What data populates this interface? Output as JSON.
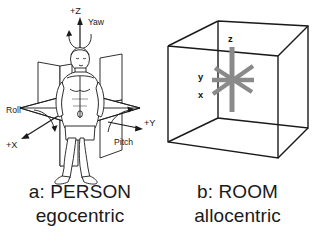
{
  "figure": {
    "background_color": "#ffffff",
    "ink_color": "#1a1a1a",
    "accent_gray": "#8a8a8a"
  },
  "panels": [
    {
      "id": "a",
      "name": "person-egocentric",
      "caption_line1": "a: PERSON",
      "caption_line2": "egocentric",
      "subject": "standing human figure at origin of three orthogonal planes",
      "axes": [
        {
          "name": "z-axis",
          "label": "+Z",
          "direction": "up",
          "rotation_label": "Yaw"
        },
        {
          "name": "x-axis",
          "label": "+X",
          "direction": "down-left",
          "rotation_label": "Roll"
        },
        {
          "name": "y-axis",
          "label": "+Y",
          "direction": "right",
          "rotation_label": "Pitch"
        }
      ],
      "rotation_labels": [
        "Yaw",
        "Roll",
        "Pitch"
      ]
    },
    {
      "id": "b",
      "name": "room-allocentric",
      "caption_line1": "b: ROOM",
      "caption_line2": "allocentric",
      "subject": "wireframe rectangular room box with gray three-axis star at center",
      "axes": [
        {
          "name": "z-axis",
          "label": "z",
          "direction": "vertical"
        },
        {
          "name": "y-axis",
          "label": "y",
          "direction": "left-horizontal"
        },
        {
          "name": "x-axis",
          "label": "x",
          "direction": "lower-left-diagonal"
        }
      ]
    }
  ]
}
